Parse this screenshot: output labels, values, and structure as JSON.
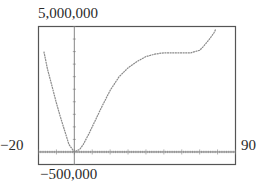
{
  "chart_data": {
    "type": "line",
    "title": "",
    "xlabel": "",
    "ylabel": "",
    "xlim": [
      -20,
      90
    ],
    "ylim": [
      -500000,
      5000000
    ],
    "xtick_minor_step": 1,
    "xtick_major_step": 10,
    "ytick_step": 500000,
    "grid": false,
    "window_labels": {
      "ymax": "5,000,000",
      "ymin": "−500,000",
      "xmin": "−20",
      "xmax": "90"
    },
    "series": [
      {
        "name": "f(x)",
        "x": [
          -17,
          -15,
          -12,
          -10,
          -8,
          -5,
          -3,
          0,
          3,
          5,
          8,
          10,
          15,
          20,
          25,
          30,
          35,
          40,
          45,
          50,
          55,
          60,
          65,
          70,
          72,
          75,
          78,
          79
        ],
        "y": [
          4000000,
          3300000,
          2500000,
          1950000,
          1450000,
          750000,
          300000,
          0,
          100000,
          300000,
          700000,
          1000000,
          1750000,
          2450000,
          3000000,
          3350000,
          3600000,
          3800000,
          3900000,
          3950000,
          3950000,
          3950000,
          3950000,
          4050000,
          4200000,
          4450000,
          4750000,
          4900000
        ]
      }
    ]
  },
  "colors": {
    "curve": "#8a8a8a",
    "frame": "#555555",
    "axis": "#777777"
  }
}
